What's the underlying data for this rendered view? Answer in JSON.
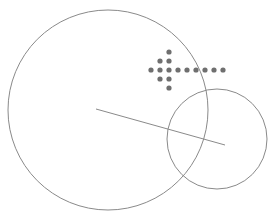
{
  "diagram": {
    "stroke_color": "#8a8a8a",
    "dot_color": "#6f6f6f",
    "background": "#ffffff",
    "circles": [
      {
        "name": "large-circle",
        "cx": 108,
        "cy": 110,
        "r": 100
      },
      {
        "name": "small-circle",
        "cx": 217,
        "cy": 139,
        "r": 50
      }
    ],
    "line": {
      "x1": 96,
      "y1": 109,
      "x2": 225,
      "y2": 145
    },
    "dots": [
      [
        169,
        52
      ],
      [
        160,
        61
      ],
      [
        169,
        61
      ],
      [
        151,
        70
      ],
      [
        160,
        70
      ],
      [
        169,
        70
      ],
      [
        178,
        70
      ],
      [
        187,
        70
      ],
      [
        196,
        70
      ],
      [
        205,
        70
      ],
      [
        214,
        70
      ],
      [
        223,
        70
      ],
      [
        160,
        79
      ],
      [
        169,
        79
      ],
      [
        169,
        88
      ]
    ],
    "dot_radius": 2.6
  }
}
